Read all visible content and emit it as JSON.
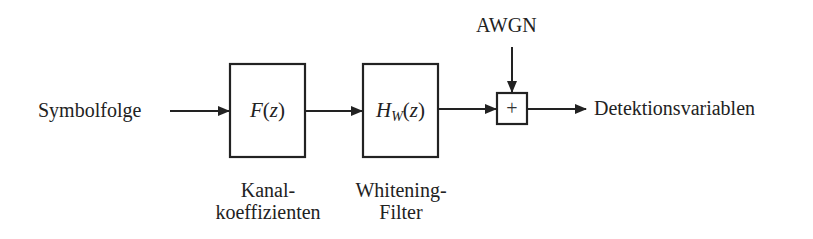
{
  "diagram": {
    "type": "block-diagram",
    "colors": {
      "line": "#222222",
      "text": "#222222",
      "background": "#ffffff"
    },
    "input_label": "Symbolfolge",
    "output_label": "Detektionsvariablen",
    "noise_label": "AWGN",
    "blocks": [
      {
        "id": "channel",
        "func_name": "F",
        "func_arg": "(z)",
        "caption_line1": "Kanal-",
        "caption_line2": "koeffizienten"
      },
      {
        "id": "whitening",
        "func_name": "H",
        "func_sub": "W",
        "func_arg": "(z)",
        "caption_line1": "Whitening-",
        "caption_line2": "Filter"
      }
    ],
    "adder": {
      "symbol": "+"
    },
    "edges": [
      {
        "from": "Symbolfolge",
        "to": "channel"
      },
      {
        "from": "channel",
        "to": "whitening"
      },
      {
        "from": "whitening",
        "to": "adder"
      },
      {
        "from": "AWGN",
        "to": "adder"
      },
      {
        "from": "adder",
        "to": "Detektionsvariablen"
      }
    ]
  }
}
